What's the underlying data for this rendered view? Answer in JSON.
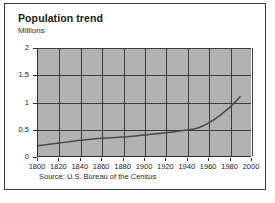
{
  "figure": {
    "title": "Population trend",
    "unit_label": "Millions",
    "source": "Source: U.S. Bureau of the Census",
    "plot_bg_color": "#b2b2b2",
    "grid_color": "#3b3b3b",
    "line_color": "#4a4a4a",
    "card_bg_color": "#ffffff",
    "border_color": "#3a3a3a"
  },
  "chart_data": {
    "type": "line",
    "title": "Population trend",
    "subtitle": "",
    "xlabel": "",
    "ylabel": "Millions",
    "xlim": [
      1800,
      2000
    ],
    "ylim": [
      0,
      2
    ],
    "grid": true,
    "legend": null,
    "xticks": [
      1800,
      1820,
      1840,
      1860,
      1880,
      1900,
      1920,
      1940,
      1960,
      1980,
      2000
    ],
    "xtick_labels": [
      "1800",
      "1820",
      "1840",
      "1860",
      "1880",
      "1900",
      "1920",
      "1940",
      "1960",
      "1980",
      "2000"
    ],
    "yticks": [
      0,
      0.5,
      1,
      1.5,
      2
    ],
    "ytick_labels": [
      "0",
      "0.5",
      "1",
      "1.5",
      "2"
    ],
    "annotation": "Source: U.S. Bureau of the Census",
    "series": [
      {
        "name": "Population",
        "x": [
          1800,
          1820,
          1840,
          1860,
          1880,
          1900,
          1920,
          1940,
          1950,
          1960,
          1970,
          1980,
          1990
        ],
        "values": [
          0.19,
          0.24,
          0.29,
          0.33,
          0.35,
          0.39,
          0.43,
          0.48,
          0.52,
          0.61,
          0.74,
          0.9,
          1.1
        ]
      }
    ]
  }
}
